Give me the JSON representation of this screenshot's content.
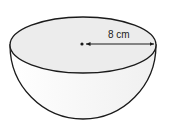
{
  "figure": {
    "type": "hemisphere",
    "radius_label": "8 cm",
    "colors": {
      "stroke": "#1a1a1a",
      "top_fill": "#ececec",
      "body_fill": "#fafafa",
      "background": "#ffffff"
    }
  }
}
